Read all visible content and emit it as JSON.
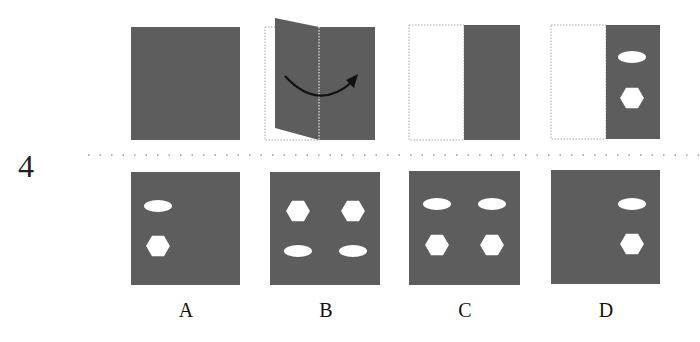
{
  "question": {
    "number": "4",
    "colors": {
      "paper": "#5d5d5d",
      "hole": "#ffffff",
      "outline": "#9a9a9a",
      "arrow": "#111111"
    },
    "steps": [
      {
        "id": "step-1",
        "description": "square paper"
      },
      {
        "id": "step-2",
        "description": "fold left half over right along dotted center line",
        "arrow": "curved-arrow-right"
      },
      {
        "id": "step-3",
        "description": "folded paper, right half remains"
      },
      {
        "id": "step-4",
        "description": "punched holes",
        "holes": [
          "ellipse",
          "hexagon"
        ]
      }
    ],
    "options": [
      {
        "label": "A",
        "holes": [
          {
            "shape": "ellipse",
            "pos": "top-left"
          },
          {
            "shape": "hexagon",
            "pos": "bottom-left"
          }
        ]
      },
      {
        "label": "B",
        "holes": [
          {
            "shape": "hexagon",
            "pos": "top-left"
          },
          {
            "shape": "hexagon",
            "pos": "top-right"
          },
          {
            "shape": "ellipse",
            "pos": "bottom-left"
          },
          {
            "shape": "ellipse",
            "pos": "bottom-right"
          }
        ]
      },
      {
        "label": "C",
        "holes": [
          {
            "shape": "ellipse",
            "pos": "top-left"
          },
          {
            "shape": "ellipse",
            "pos": "top-right"
          },
          {
            "shape": "hexagon",
            "pos": "bottom-left"
          },
          {
            "shape": "hexagon",
            "pos": "bottom-right"
          }
        ]
      },
      {
        "label": "D",
        "holes": [
          {
            "shape": "ellipse",
            "pos": "top-right"
          },
          {
            "shape": "hexagon",
            "pos": "bottom-right"
          }
        ]
      }
    ]
  }
}
